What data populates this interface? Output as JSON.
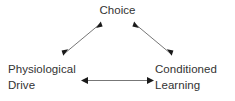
{
  "diagram": {
    "background_color": "#ffffff",
    "text_color": "#333333",
    "line_color": "#777777",
    "arrowhead_color": "#1a1a1a",
    "nodes": [
      {
        "id": "choice",
        "label": "Choice",
        "lines": [
          "Choice"
        ],
        "position": "top-center"
      },
      {
        "id": "physiological-drive",
        "label": "Physiological Drive",
        "lines": [
          "Physiological",
          "Drive"
        ],
        "position": "bottom-left"
      },
      {
        "id": "conditioned-learning",
        "label": "Conditioned Learning",
        "lines": [
          "Conditioned",
          "Learning"
        ],
        "position": "bottom-right"
      }
    ],
    "edges": [
      {
        "id": "edge-drive-choice",
        "from": "physiological-drive",
        "to": "choice",
        "style": "double-headed-arrow",
        "orientation": "diagonal-left"
      },
      {
        "id": "edge-choice-learning",
        "from": "choice",
        "to": "conditioned-learning",
        "style": "double-headed-arrow",
        "orientation": "diagonal-right"
      },
      {
        "id": "edge-drive-learning",
        "from": "physiological-drive",
        "to": "conditioned-learning",
        "style": "double-headed-arrow",
        "orientation": "horizontal"
      }
    ]
  }
}
